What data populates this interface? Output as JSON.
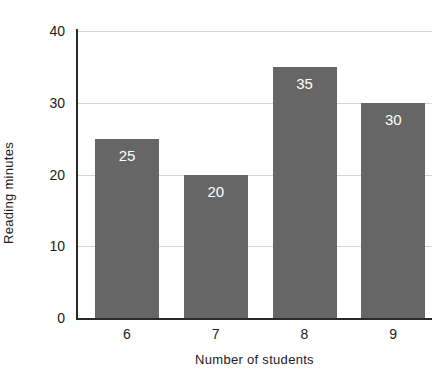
{
  "chart_data": {
    "type": "bar",
    "title": "",
    "subtitle": "",
    "xlabel": "Number of students",
    "ylabel": "Reading minutes",
    "categories": [
      "6",
      "7",
      "8",
      "9"
    ],
    "values": [
      25,
      20,
      35,
      30
    ],
    "data_labels": [
      "25",
      "20",
      "35",
      "30"
    ],
    "ylim": [
      0,
      40
    ],
    "yticks": [
      0,
      10,
      20,
      30,
      40
    ],
    "ytick_labels": [
      "0",
      "10",
      "20",
      "30",
      "40"
    ],
    "grid": "horizontal",
    "legend": "none",
    "orientation": "vertical",
    "annotations": []
  },
  "style": {
    "background_color": "#ffffff",
    "bar_color": "#666666",
    "gridline_color": "#d6d6d6",
    "axis_color": "#2a2a2a",
    "text_color": "#1b1b1b",
    "data_label_color": "#ffffff"
  }
}
